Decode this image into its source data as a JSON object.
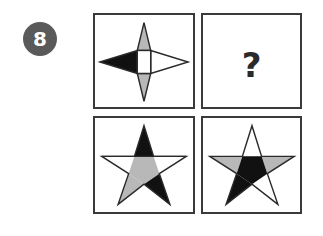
{
  "question": {
    "number": "8",
    "badge_color": "#5a5a5a"
  },
  "grid": {
    "cells": [
      {
        "id": "top-left",
        "content": "four-point-star",
        "fills": {
          "left": "#111111",
          "top": "#b8b8b8",
          "bottom": "#b8b8b8",
          "right": "#ffffff",
          "center": "#ffffff"
        }
      },
      {
        "id": "top-right",
        "content": "question-mark",
        "label": "?"
      },
      {
        "id": "bottom-left",
        "content": "five-point-star",
        "fills": {
          "top": "#111111",
          "center": "#b8b8b8",
          "lower-left": "#b8b8b8",
          "lower-right": "#111111"
        }
      },
      {
        "id": "bottom-right",
        "content": "five-point-star",
        "fills": {
          "left-arm": "#b8b8b8",
          "right-arm": "#b8b8b8",
          "center": "#111111",
          "lower-left": "#111111"
        }
      }
    ]
  },
  "colors": {
    "border": "#3a3a3a",
    "dark": "#111111",
    "gray": "#b8b8b8"
  }
}
